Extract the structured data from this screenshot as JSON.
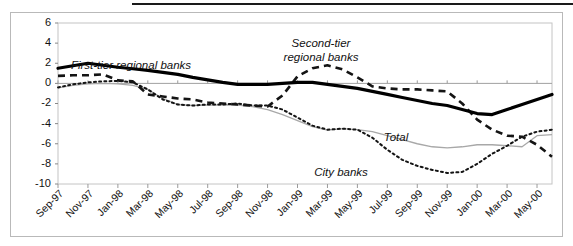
{
  "chart_data": {
    "type": "line",
    "title": "",
    "xlabel": "",
    "ylabel": "",
    "ylim": [
      -10,
      6
    ],
    "yticks": [
      6,
      4,
      2,
      0,
      -2,
      -4,
      -6,
      -8,
      -10
    ],
    "ytick_labels": [
      "6",
      "4",
      "2",
      "0",
      "-2",
      "-4",
      "-6",
      "-8",
      "-10"
    ],
    "grid": false,
    "legend": "inline-annotations",
    "x": [
      "Sep-97",
      "Oct-97",
      "Nov-97",
      "Dec-97",
      "Jan-98",
      "Feb-98",
      "Mar-98",
      "Apr-98",
      "May-98",
      "Jun-98",
      "Jul-98",
      "Aug-98",
      "Sep-98",
      "Oct-98",
      "Nov-98",
      "Dec-98",
      "Jan-99",
      "Feb-99",
      "Mar-99",
      "Apr-99",
      "May-99",
      "Jun-99",
      "Jul-99",
      "Aug-99",
      "Sep-99",
      "Oct-99",
      "Nov-99",
      "Dec-99",
      "Jan-00",
      "Feb-00",
      "Mar-00",
      "Apr-00",
      "May-00",
      "Jun-00"
    ],
    "xtick_labels": [
      "Sep-97",
      "Nov-97",
      "Jan-98",
      "Mar-98",
      "May-98",
      "Jul-98",
      "Sep-98",
      "Nov-98",
      "Jan-99",
      "Mar-99",
      "May-99",
      "Jul-99",
      "Sep-99",
      "Nov-99",
      "Jan-00",
      "Mar-00",
      "May-00"
    ],
    "xtick_indices": [
      0,
      2,
      4,
      6,
      8,
      10,
      12,
      14,
      16,
      18,
      20,
      22,
      24,
      26,
      28,
      30,
      32
    ],
    "series": [
      {
        "name": "First-tier regional banks",
        "style": "thick-solid-black",
        "color": "#000000",
        "values": [
          1.5,
          1.75,
          2.0,
          1.8,
          1.6,
          1.45,
          1.3,
          1.1,
          0.9,
          0.6,
          0.35,
          0.1,
          -0.1,
          -0.1,
          -0.1,
          0.0,
          0.1,
          0.1,
          -0.1,
          -0.3,
          -0.5,
          -0.8,
          -1.1,
          -1.4,
          -1.7,
          -2.0,
          -2.2,
          -2.6,
          -3.0,
          -3.1,
          -2.6,
          -2.1,
          -1.6,
          -1.1
        ]
      },
      {
        "name": "Second-tier regional banks",
        "style": "dashed-black",
        "color": "#111111",
        "values": [
          0.75,
          0.8,
          0.8,
          0.9,
          0.3,
          0.2,
          -1.1,
          -1.3,
          -1.5,
          -1.6,
          -1.9,
          -2.0,
          -2.1,
          -2.2,
          -2.3,
          -1.2,
          0.7,
          1.5,
          1.8,
          1.4,
          0.6,
          -0.3,
          -0.5,
          -0.6,
          -0.6,
          -0.7,
          -0.8,
          -2.0,
          -3.6,
          -4.6,
          -5.2,
          -5.3,
          -6.1,
          -7.3
        ]
      },
      {
        "name": "City banks",
        "style": "fine-dotted-black",
        "color": "#111111",
        "values": [
          -0.4,
          -0.1,
          0.1,
          0.2,
          0.25,
          0.1,
          -0.6,
          -1.6,
          -2.1,
          -2.2,
          -2.1,
          -2.1,
          -2.0,
          -2.2,
          -2.2,
          -2.6,
          -3.4,
          -4.2,
          -4.6,
          -4.5,
          -4.6,
          -5.4,
          -6.6,
          -7.6,
          -8.2,
          -8.6,
          -8.9,
          -8.8,
          -8.0,
          -7.0,
          -6.2,
          -5.3,
          -4.8,
          -4.6
        ]
      },
      {
        "name": "Total",
        "style": "thin-solid-gray",
        "color": "#a6a6a6",
        "values": [
          -0.45,
          -0.2,
          -0.05,
          0.0,
          -0.05,
          -0.2,
          -0.6,
          -1.5,
          -2.1,
          -2.2,
          -2.15,
          -2.15,
          -2.15,
          -2.3,
          -2.6,
          -3.1,
          -3.7,
          -4.3,
          -4.65,
          -4.5,
          -4.6,
          -4.8,
          -5.2,
          -5.6,
          -6.0,
          -6.3,
          -6.4,
          -6.3,
          -6.1,
          -6.1,
          -6.2,
          -6.3,
          -5.2,
          -5.1
        ]
      }
    ],
    "annotations": [
      {
        "text": "First-tier regional banks",
        "series": "First-tier regional banks"
      },
      {
        "text": "Second-tier regional banks",
        "series": "Second-tier regional banks",
        "line1": "Second-tier",
        "line2": "regional banks"
      },
      {
        "text": "City banks",
        "series": "City banks"
      },
      {
        "text": "Total",
        "series": "Total"
      }
    ]
  }
}
